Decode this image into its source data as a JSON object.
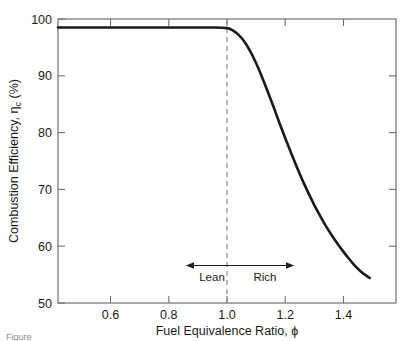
{
  "chart_data": {
    "type": "line",
    "title": "",
    "xlabel": "Fuel Equivalence Ratio, ϕ",
    "ylabel": "Combustion Efficiency, ηc (%)",
    "ylabel_main": "Combustion Efficiency, η",
    "ylabel_sub": "c",
    "ylabel_tail": " (%)",
    "xlabel_main": "Fuel Equivalence Ratio, ",
    "xlabel_symbol": "ϕ",
    "xlim": [
      0.42,
      1.58
    ],
    "ylim": [
      50,
      100
    ],
    "grid": false,
    "legend": null,
    "xticks": [
      0.6,
      0.8,
      1.0,
      1.2,
      1.4
    ],
    "xtick_labels": [
      "0.6",
      "0.8",
      "1.0",
      "1.2",
      "1.4"
    ],
    "yticks": [
      50,
      60,
      70,
      80,
      90,
      100
    ],
    "ytick_labels": [
      "50",
      "60",
      "70",
      "80",
      "90",
      "100"
    ],
    "series": [
      {
        "name": "Combustion efficiency",
        "color": "#1a1a1a",
        "linewidth": 2.6,
        "x": [
          0.42,
          0.5,
          0.6,
          0.7,
          0.8,
          0.9,
          0.95,
          1.0,
          1.02,
          1.04,
          1.06,
          1.08,
          1.1,
          1.12,
          1.14,
          1.16,
          1.18,
          1.2,
          1.22,
          1.24,
          1.26,
          1.28,
          1.3,
          1.32,
          1.34,
          1.36,
          1.38,
          1.4,
          1.42,
          1.44,
          1.46,
          1.49
        ],
        "y": [
          98.5,
          98.5,
          98.5,
          98.5,
          98.5,
          98.5,
          98.5,
          98.4,
          98.0,
          97.2,
          96.0,
          94.3,
          92.2,
          89.8,
          87.2,
          84.5,
          81.7,
          79.0,
          76.4,
          73.9,
          71.5,
          69.3,
          67.2,
          65.3,
          63.5,
          61.9,
          60.4,
          59.0,
          57.7,
          56.5,
          55.5,
          54.4
        ]
      }
    ],
    "annotations": [
      {
        "name": "stoichiometric-line",
        "type": "vline",
        "x": 1.0,
        "style": "dashed",
        "color": "#7a7a7a",
        "label": ""
      },
      {
        "name": "lean-rich-arrow",
        "type": "double-arrow",
        "x_start": 0.66,
        "x_end": 1.22,
        "y": 56.6,
        "color": "#1a1a1a"
      },
      {
        "name": "lean-label",
        "type": "text",
        "text": "Lean",
        "x": 0.79,
        "y": 53.8
      },
      {
        "name": "rich-label",
        "type": "text",
        "text": "Rich",
        "x": 1.16,
        "y": 53.8
      }
    ]
  },
  "caption": {
    "prefix": "Figure",
    "text": ""
  }
}
